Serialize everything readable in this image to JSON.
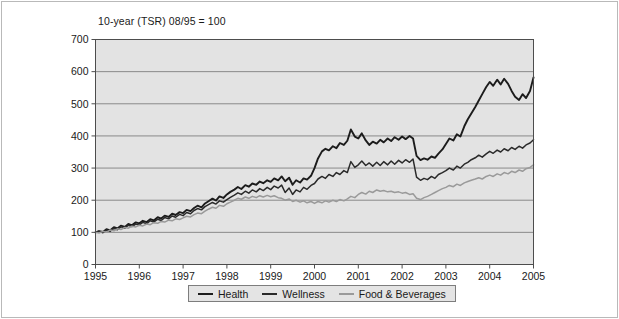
{
  "figure": {
    "background_color": "#ffffff",
    "border_color": "#b9b9b9",
    "plot_background_color": "#e3e3e3",
    "grid_color": "#8a8a8a",
    "axis_color": "#4d4d4d"
  },
  "chart_data": {
    "type": "line",
    "title": "10-year (TSR) 08/95 = 100",
    "xlabel": "",
    "ylabel": "",
    "xlim": [
      1995,
      2005
    ],
    "ylim": [
      0,
      700
    ],
    "yticks": [
      0,
      100,
      200,
      300,
      400,
      500,
      600,
      700
    ],
    "xticks": [
      1995,
      1996,
      1997,
      1998,
      1999,
      2000,
      2001,
      2002,
      2003,
      2004,
      2005
    ],
    "grid": true,
    "legend_position": "bottom-center",
    "legend_entries": [
      "Health",
      "Wellness",
      "Food & Beverages"
    ],
    "series": [
      {
        "name": "Health",
        "color": "#1c1c1c",
        "width": 1.9,
        "x": [
          1995.0,
          1995.08,
          1995.17,
          1995.25,
          1995.33,
          1995.42,
          1995.5,
          1995.58,
          1995.67,
          1995.75,
          1995.83,
          1995.92,
          1996.0,
          1996.08,
          1996.17,
          1996.25,
          1996.33,
          1996.42,
          1996.5,
          1996.58,
          1996.67,
          1996.75,
          1996.83,
          1996.92,
          1997.0,
          1997.08,
          1997.17,
          1997.25,
          1997.33,
          1997.42,
          1997.5,
          1997.58,
          1997.67,
          1997.75,
          1997.83,
          1997.92,
          1998.0,
          1998.08,
          1998.17,
          1998.25,
          1998.33,
          1998.42,
          1998.5,
          1998.58,
          1998.67,
          1998.75,
          1998.83,
          1998.92,
          1999.0,
          1999.08,
          1999.17,
          1999.25,
          1999.33,
          1999.42,
          1999.5,
          1999.58,
          1999.67,
          1999.75,
          1999.83,
          1999.92,
          2000.0,
          2000.08,
          2000.17,
          2000.25,
          2000.33,
          2000.42,
          2000.5,
          2000.58,
          2000.67,
          2000.75,
          2000.83,
          2000.92,
          2001.0,
          2001.08,
          2001.17,
          2001.25,
          2001.33,
          2001.42,
          2001.5,
          2001.58,
          2001.67,
          2001.75,
          2001.83,
          2001.92,
          2002.0,
          2002.08,
          2002.17,
          2002.25,
          2002.33,
          2002.42,
          2002.5,
          2002.58,
          2002.67,
          2002.75,
          2002.83,
          2002.92,
          2003.0,
          2003.08,
          2003.17,
          2003.25,
          2003.33,
          2003.42,
          2003.5,
          2003.58,
          2003.67,
          2003.75,
          2003.83,
          2003.92,
          2004.0,
          2004.08,
          2004.17,
          2004.25,
          2004.33,
          2004.42,
          2004.5,
          2004.58,
          2004.67,
          2004.75,
          2004.83,
          2004.92,
          2005.0
        ],
        "values": [
          100,
          104,
          101,
          110,
          106,
          116,
          112,
          121,
          117,
          126,
          122,
          131,
          128,
          136,
          132,
          141,
          137,
          147,
          143,
          152,
          148,
          158,
          154,
          163,
          160,
          170,
          166,
          176,
          183,
          178,
          190,
          197,
          205,
          199,
          212,
          207,
          218,
          226,
          233,
          241,
          235,
          247,
          242,
          252,
          248,
          258,
          253,
          262,
          257,
          268,
          262,
          274,
          259,
          270,
          248,
          262,
          255,
          268,
          264,
          276,
          300,
          330,
          352,
          360,
          355,
          368,
          362,
          378,
          372,
          385,
          420,
          398,
          392,
          408,
          386,
          372,
          382,
          376,
          388,
          380,
          392,
          384,
          396,
          388,
          398,
          390,
          400,
          392,
          338,
          325,
          330,
          326,
          336,
          332,
          345,
          358,
          375,
          392,
          386,
          405,
          398,
          430,
          452,
          470,
          490,
          510,
          530,
          552,
          568,
          556,
          575,
          560,
          578,
          562,
          540,
          522,
          512,
          530,
          518,
          540,
          582
        ]
      },
      {
        "name": "Wellness",
        "color": "#2a2a2a",
        "width": 1.5,
        "x": [
          1995.0,
          1995.08,
          1995.17,
          1995.25,
          1995.33,
          1995.42,
          1995.5,
          1995.58,
          1995.67,
          1995.75,
          1995.83,
          1995.92,
          1996.0,
          1996.08,
          1996.17,
          1996.25,
          1996.33,
          1996.42,
          1996.5,
          1996.58,
          1996.67,
          1996.75,
          1996.83,
          1996.92,
          1997.0,
          1997.08,
          1997.17,
          1997.25,
          1997.33,
          1997.42,
          1997.5,
          1997.58,
          1997.67,
          1997.75,
          1997.83,
          1997.92,
          1998.0,
          1998.08,
          1998.17,
          1998.25,
          1998.33,
          1998.42,
          1998.5,
          1998.58,
          1998.67,
          1998.75,
          1998.83,
          1998.92,
          1999.0,
          1999.08,
          1999.17,
          1999.25,
          1999.33,
          1999.42,
          1999.5,
          1999.58,
          1999.67,
          1999.75,
          1999.83,
          1999.92,
          2000.0,
          2000.08,
          2000.17,
          2000.25,
          2000.33,
          2000.42,
          2000.5,
          2000.58,
          2000.67,
          2000.75,
          2000.83,
          2000.92,
          2001.0,
          2001.08,
          2001.17,
          2001.25,
          2001.33,
          2001.42,
          2001.5,
          2001.58,
          2001.67,
          2001.75,
          2001.83,
          2001.92,
          2002.0,
          2002.08,
          2002.17,
          2002.25,
          2002.33,
          2002.42,
          2002.5,
          2002.58,
          2002.67,
          2002.75,
          2002.83,
          2002.92,
          2003.0,
          2003.08,
          2003.17,
          2003.25,
          2003.33,
          2003.42,
          2003.5,
          2003.58,
          2003.67,
          2003.75,
          2003.83,
          2003.92,
          2004.0,
          2004.08,
          2004.17,
          2004.25,
          2004.33,
          2004.42,
          2004.5,
          2004.58,
          2004.67,
          2004.75,
          2004.83,
          2004.92,
          2005.0
        ],
        "values": [
          100,
          103,
          99,
          107,
          103,
          112,
          108,
          117,
          113,
          122,
          118,
          126,
          123,
          131,
          127,
          136,
          132,
          141,
          137,
          146,
          142,
          151,
          147,
          156,
          152,
          162,
          158,
          168,
          174,
          170,
          180,
          186,
          193,
          188,
          198,
          194,
          202,
          209,
          216,
          223,
          218,
          228,
          222,
          232,
          226,
          236,
          230,
          240,
          233,
          244,
          238,
          247,
          224,
          238,
          218,
          232,
          226,
          240,
          234,
          246,
          252,
          266,
          274,
          268,
          280,
          274,
          286,
          280,
          292,
          286,
          320,
          302,
          310,
          322,
          308,
          316,
          306,
          318,
          308,
          320,
          310,
          322,
          312,
          324,
          316,
          326,
          318,
          328,
          272,
          262,
          268,
          264,
          274,
          268,
          280,
          286,
          292,
          300,
          294,
          306,
          300,
          312,
          318,
          326,
          332,
          340,
          334,
          344,
          352,
          346,
          356,
          350,
          360,
          354,
          364,
          358,
          368,
          362,
          372,
          378,
          388
        ]
      },
      {
        "name": "Food & Beverages",
        "color": "#9a9a9a",
        "width": 1.5,
        "x": [
          1995.0,
          1995.08,
          1995.17,
          1995.25,
          1995.33,
          1995.42,
          1995.5,
          1995.58,
          1995.67,
          1995.75,
          1995.83,
          1995.92,
          1996.0,
          1996.08,
          1996.17,
          1996.25,
          1996.33,
          1996.42,
          1996.5,
          1996.58,
          1996.67,
          1996.75,
          1996.83,
          1996.92,
          1997.0,
          1997.08,
          1997.17,
          1997.25,
          1997.33,
          1997.42,
          1997.5,
          1997.58,
          1997.67,
          1997.75,
          1997.83,
          1997.92,
          1998.0,
          1998.08,
          1998.17,
          1998.25,
          1998.33,
          1998.42,
          1998.5,
          1998.58,
          1998.67,
          1998.75,
          1998.83,
          1998.92,
          1999.0,
          1999.08,
          1999.17,
          1999.25,
          1999.33,
          1999.42,
          1999.5,
          1999.58,
          1999.67,
          1999.75,
          1999.83,
          1999.92,
          2000.0,
          2000.08,
          2000.17,
          2000.25,
          2000.33,
          2000.42,
          2000.5,
          2000.58,
          2000.67,
          2000.75,
          2000.83,
          2000.92,
          2001.0,
          2001.08,
          2001.17,
          2001.25,
          2001.33,
          2001.42,
          2001.5,
          2001.58,
          2001.67,
          2001.75,
          2001.83,
          2001.92,
          2002.0,
          2002.08,
          2002.17,
          2002.25,
          2002.33,
          2002.42,
          2002.5,
          2002.58,
          2002.67,
          2002.75,
          2002.83,
          2002.92,
          2003.0,
          2003.08,
          2003.17,
          2003.25,
          2003.33,
          2003.42,
          2003.5,
          2003.58,
          2003.67,
          2003.75,
          2003.83,
          2003.92,
          2004.0,
          2004.08,
          2004.17,
          2004.25,
          2004.33,
          2004.42,
          2004.5,
          2004.58,
          2004.67,
          2004.75,
          2004.83,
          2004.92,
          2005.0
        ],
        "values": [
          100,
          98,
          103,
          101,
          107,
          105,
          111,
          109,
          115,
          113,
          119,
          117,
          122,
          120,
          126,
          124,
          130,
          128,
          134,
          132,
          138,
          136,
          142,
          140,
          145,
          150,
          148,
          155,
          160,
          158,
          166,
          172,
          178,
          175,
          184,
          181,
          189,
          194,
          200,
          206,
          203,
          210,
          206,
          212,
          208,
          214,
          210,
          215,
          211,
          214,
          208,
          206,
          200,
          204,
          196,
          200,
          194,
          198,
          192,
          196,
          190,
          196,
          192,
          198,
          194,
          200,
          196,
          202,
          198,
          204,
          212,
          208,
          218,
          224,
          219,
          228,
          224,
          232,
          228,
          230,
          226,
          228,
          224,
          226,
          222,
          224,
          218,
          220,
          206,
          202,
          208,
          212,
          218,
          224,
          230,
          236,
          240,
          246,
          242,
          250,
          246,
          254,
          258,
          262,
          266,
          270,
          266,
          274,
          278,
          274,
          282,
          278,
          286,
          282,
          290,
          286,
          294,
          290,
          298,
          302,
          310
        ]
      }
    ]
  }
}
